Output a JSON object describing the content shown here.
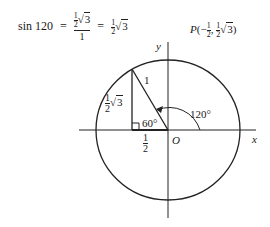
{
  "equation": {
    "lhs": "sin 120",
    "equals1": "=",
    "numerator_coef_num": "1",
    "numerator_coef_den": "2",
    "numerator_radicand": "3",
    "denominator": "1",
    "equals2": "=",
    "rhs_coef_num": "1",
    "rhs_coef_den": "2",
    "rhs_radicand": "3"
  },
  "point_label": {
    "name": "P",
    "open": "(",
    "x_sign": "−",
    "x_num": "1",
    "x_den": "2",
    "comma": ",",
    "y_num": "1",
    "y_den": "2",
    "y_radicand": "3",
    "close": ")"
  },
  "diagram": {
    "x_axis_label": "x",
    "y_axis_label": "y",
    "origin_label": "O",
    "hypotenuse_label": "1",
    "angle_label": "120°",
    "reference_angle_label": "60°",
    "base_num": "1",
    "base_den": "2",
    "height_num": "1",
    "height_den": "2",
    "height_radicand": "3"
  }
}
